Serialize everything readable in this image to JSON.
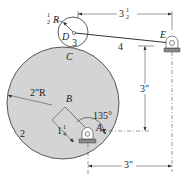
{
  "diagram": {
    "labels": {
      "small_radius": "R",
      "small_radius_whole": "",
      "small_radius_frac_num": "1",
      "small_radius_frac_den": "2",
      "point_D": "D",
      "link_3": "3",
      "point_C": "C",
      "link_length_whole": "3",
      "link_length_frac_num": "1",
      "link_length_frac_den": "2",
      "link_4": "4",
      "point_E": "E",
      "vertical_dim": "3\"",
      "disk_radius": "2\"R",
      "point_B": "B",
      "angle": "135°",
      "link_2": "2",
      "offset_whole": "1",
      "offset_frac_num": "1",
      "offset_frac_den": "4",
      "point_A": "A",
      "horizontal_dim": "3\""
    },
    "colors": {
      "disk_fill": "#d4d4d4",
      "stroke": "#333333",
      "ground": "#888888"
    }
  }
}
